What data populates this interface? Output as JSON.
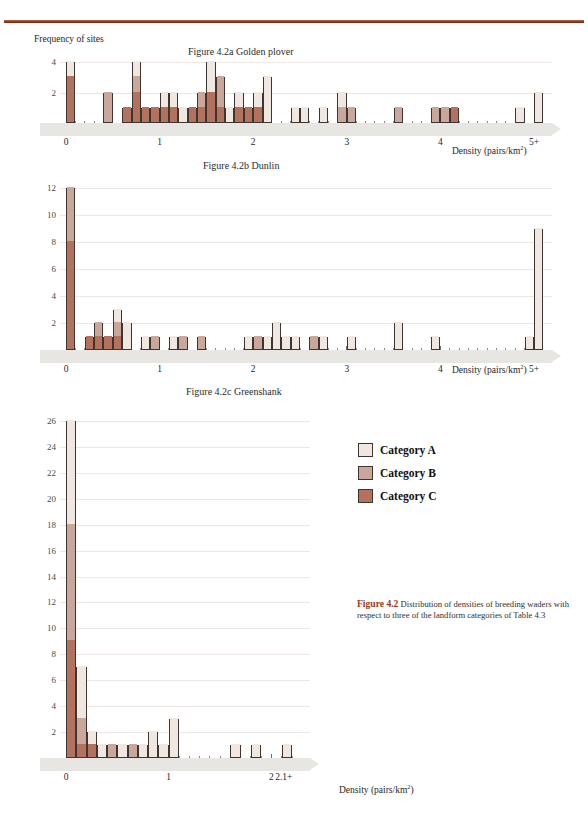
{
  "figure": {
    "caption_label": "Figure 4.2",
    "caption_text": " Distribution of densities of breeding waders with respect to three of the landform categories of Table 4.3"
  },
  "legend": {
    "items": [
      {
        "label": "Category A",
        "color": "#f0e8e0"
      },
      {
        "label": "Category B",
        "color": "#c9a79b"
      },
      {
        "label": "Category C",
        "color": "#b2725e"
      }
    ]
  },
  "colors": {
    "rule": "#8b3a20",
    "category_a": "#f0e8e0",
    "category_b": "#c9a79b",
    "category_c": "#b2725e",
    "bar_outline": "#3d3531",
    "x_band": "#e8e6e3",
    "gridline": "#efe7e4"
  },
  "chart_data": [
    {
      "type": "bar",
      "id": "golden-plover",
      "title": "Figure 4.2a Golden plover",
      "ylabel": "Frequency of sites",
      "xlabel": "Density (pairs/km2)",
      "xlabel_html": "Density (pairs/km²)",
      "ylim": [
        0,
        5
      ],
      "yticks": [
        2,
        4
      ],
      "xticks": [
        0,
        1,
        2,
        3,
        4,
        5
      ],
      "xtick_labels": [
        "0",
        "1",
        "2",
        "3",
        "4",
        "5+"
      ],
      "bin_width": 0.1,
      "grid": true,
      "legend_position": "external",
      "stacked_series": [
        "Category A",
        "Category B",
        "Category C"
      ],
      "bins": [
        {
          "x": 0.0,
          "total": 4,
          "a": 1,
          "b": 0,
          "c": 3
        },
        {
          "x": 0.4,
          "total": 2,
          "a": 0,
          "b": 2,
          "c": 0
        },
        {
          "x": 0.6,
          "total": 1,
          "a": 0,
          "b": 0,
          "c": 1
        },
        {
          "x": 0.7,
          "total": 4,
          "a": 1,
          "b": 1,
          "c": 2
        },
        {
          "x": 0.8,
          "total": 1,
          "a": 0,
          "b": 0,
          "c": 1
        },
        {
          "x": 0.9,
          "total": 1,
          "a": 0,
          "b": 0,
          "c": 1
        },
        {
          "x": 1.0,
          "total": 2,
          "a": 1,
          "b": 0,
          "c": 1
        },
        {
          "x": 1.1,
          "total": 2,
          "a": 1,
          "b": 0,
          "c": 1
        },
        {
          "x": 1.2,
          "total": 1,
          "a": 1,
          "b": 0,
          "c": 0
        },
        {
          "x": 1.3,
          "total": 1,
          "a": 0,
          "b": 0,
          "c": 1
        },
        {
          "x": 1.4,
          "total": 2,
          "a": 0,
          "b": 1,
          "c": 1
        },
        {
          "x": 1.5,
          "total": 4,
          "a": 2,
          "b": 0,
          "c": 2
        },
        {
          "x": 1.6,
          "total": 3,
          "a": 0,
          "b": 2,
          "c": 1
        },
        {
          "x": 1.7,
          "total": 1,
          "a": 1,
          "b": 0,
          "c": 0
        },
        {
          "x": 1.8,
          "total": 2,
          "a": 1,
          "b": 0,
          "c": 1
        },
        {
          "x": 1.9,
          "total": 1,
          "a": 0,
          "b": 0,
          "c": 1
        },
        {
          "x": 2.0,
          "total": 2,
          "a": 1,
          "b": 0,
          "c": 1
        },
        {
          "x": 2.1,
          "total": 3,
          "a": 3,
          "b": 0,
          "c": 0
        },
        {
          "x": 2.4,
          "total": 1,
          "a": 1,
          "b": 0,
          "c": 0
        },
        {
          "x": 2.5,
          "total": 1,
          "a": 1,
          "b": 0,
          "c": 0
        },
        {
          "x": 2.7,
          "total": 1,
          "a": 1,
          "b": 0,
          "c": 0
        },
        {
          "x": 2.9,
          "total": 2,
          "a": 1,
          "b": 1,
          "c": 0
        },
        {
          "x": 3.0,
          "total": 1,
          "a": 0,
          "b": 1,
          "c": 0
        },
        {
          "x": 3.5,
          "total": 1,
          "a": 0,
          "b": 1,
          "c": 0
        },
        {
          "x": 3.9,
          "total": 1,
          "a": 0,
          "b": 1,
          "c": 0
        },
        {
          "x": 4.0,
          "total": 1,
          "a": 0,
          "b": 1,
          "c": 0
        },
        {
          "x": 4.1,
          "total": 1,
          "a": 0,
          "b": 0,
          "c": 1
        },
        {
          "x": 4.8,
          "total": 1,
          "a": 1,
          "b": 0,
          "c": 0
        },
        {
          "x": 5.0,
          "total": 2,
          "a": 2,
          "b": 0,
          "c": 0
        }
      ]
    },
    {
      "type": "bar",
      "id": "dunlin",
      "title": "Figure 4.2b Dunlin",
      "ylabel": "Frequency of sites",
      "xlabel": "Density (pairs/km2)",
      "xlabel_html": "Density (pairs/km²)",
      "ylim": [
        0,
        13
      ],
      "yticks": [
        2,
        4,
        6,
        8,
        10,
        12
      ],
      "xticks": [
        0,
        1,
        2,
        3,
        4,
        5
      ],
      "xtick_labels": [
        "0",
        "1",
        "2",
        "3",
        "4",
        "5+"
      ],
      "bin_width": 0.1,
      "grid": true,
      "stacked_series": [
        "Category A",
        "Category B",
        "Category C"
      ],
      "bins": [
        {
          "x": 0.0,
          "total": 12,
          "a": 0,
          "b": 4,
          "c": 8
        },
        {
          "x": 0.2,
          "total": 1,
          "a": 0,
          "b": 0,
          "c": 1
        },
        {
          "x": 0.3,
          "total": 2,
          "a": 0,
          "b": 1,
          "c": 1
        },
        {
          "x": 0.4,
          "total": 1,
          "a": 0,
          "b": 0,
          "c": 1
        },
        {
          "x": 0.5,
          "total": 3,
          "a": 1,
          "b": 1,
          "c": 1
        },
        {
          "x": 0.6,
          "total": 2,
          "a": 2,
          "b": 0,
          "c": 0
        },
        {
          "x": 0.8,
          "total": 1,
          "a": 1,
          "b": 0,
          "c": 0
        },
        {
          "x": 0.9,
          "total": 1,
          "a": 0,
          "b": 1,
          "c": 0
        },
        {
          "x": 1.1,
          "total": 1,
          "a": 1,
          "b": 0,
          "c": 0
        },
        {
          "x": 1.2,
          "total": 1,
          "a": 0,
          "b": 1,
          "c": 0
        },
        {
          "x": 1.4,
          "total": 1,
          "a": 0,
          "b": 1,
          "c": 0
        },
        {
          "x": 1.9,
          "total": 1,
          "a": 1,
          "b": 0,
          "c": 0
        },
        {
          "x": 2.0,
          "total": 1,
          "a": 0,
          "b": 1,
          "c": 0
        },
        {
          "x": 2.1,
          "total": 1,
          "a": 1,
          "b": 0,
          "c": 0
        },
        {
          "x": 2.2,
          "total": 2,
          "a": 2,
          "b": 0,
          "c": 0
        },
        {
          "x": 2.3,
          "total": 1,
          "a": 1,
          "b": 0,
          "c": 0
        },
        {
          "x": 2.4,
          "total": 1,
          "a": 1,
          "b": 0,
          "c": 0
        },
        {
          "x": 2.6,
          "total": 1,
          "a": 0,
          "b": 1,
          "c": 0
        },
        {
          "x": 2.7,
          "total": 1,
          "a": 1,
          "b": 0,
          "c": 0
        },
        {
          "x": 3.0,
          "total": 1,
          "a": 1,
          "b": 0,
          "c": 0
        },
        {
          "x": 3.5,
          "total": 2,
          "a": 2,
          "b": 0,
          "c": 0
        },
        {
          "x": 3.9,
          "total": 1,
          "a": 1,
          "b": 0,
          "c": 0
        },
        {
          "x": 4.9,
          "total": 1,
          "a": 1,
          "b": 0,
          "c": 0
        },
        {
          "x": 5.0,
          "total": 9,
          "a": 9,
          "b": 0,
          "c": 0
        }
      ]
    },
    {
      "type": "bar",
      "id": "greenshank",
      "title": "Figure 4.2c Greenshank",
      "ylabel": "Frequency of sites",
      "xlabel": "Density (pairs/km2)",
      "xlabel_html": "Density (pairs/km²)",
      "ylim": [
        0,
        27
      ],
      "yticks": [
        2,
        4,
        6,
        8,
        10,
        12,
        14,
        16,
        18,
        20,
        22,
        24,
        26
      ],
      "xticks": [
        0,
        1,
        2
      ],
      "xtick_labels": [
        "0",
        "1",
        "2",
        "2.1+"
      ],
      "bin_width": 0.1,
      "grid": true,
      "stacked_series": [
        "Category A",
        "Category B",
        "Category C"
      ],
      "bins": [
        {
          "x": 0.0,
          "total": 26,
          "a": 8,
          "b": 9,
          "c": 9
        },
        {
          "x": 0.1,
          "total": 7,
          "a": 4,
          "b": 2,
          "c": 1
        },
        {
          "x": 0.2,
          "total": 2,
          "a": 1,
          "b": 0,
          "c": 1
        },
        {
          "x": 0.3,
          "total": 1,
          "a": 1,
          "b": 0,
          "c": 0
        },
        {
          "x": 0.4,
          "total": 1,
          "a": 0,
          "b": 1,
          "c": 0
        },
        {
          "x": 0.5,
          "total": 1,
          "a": 1,
          "b": 0,
          "c": 0
        },
        {
          "x": 0.6,
          "total": 1,
          "a": 0,
          "b": 1,
          "c": 0
        },
        {
          "x": 0.7,
          "total": 1,
          "a": 1,
          "b": 0,
          "c": 0
        },
        {
          "x": 0.8,
          "total": 2,
          "a": 2,
          "b": 0,
          "c": 0
        },
        {
          "x": 0.9,
          "total": 1,
          "a": 1,
          "b": 0,
          "c": 0
        },
        {
          "x": 1.0,
          "total": 3,
          "a": 3,
          "b": 0,
          "c": 0
        },
        {
          "x": 1.6,
          "total": 1,
          "a": 1,
          "b": 0,
          "c": 0
        },
        {
          "x": 1.8,
          "total": 1,
          "a": 1,
          "b": 0,
          "c": 0
        },
        {
          "x": 2.1,
          "total": 1,
          "a": 1,
          "b": 0,
          "c": 0
        }
      ]
    }
  ]
}
